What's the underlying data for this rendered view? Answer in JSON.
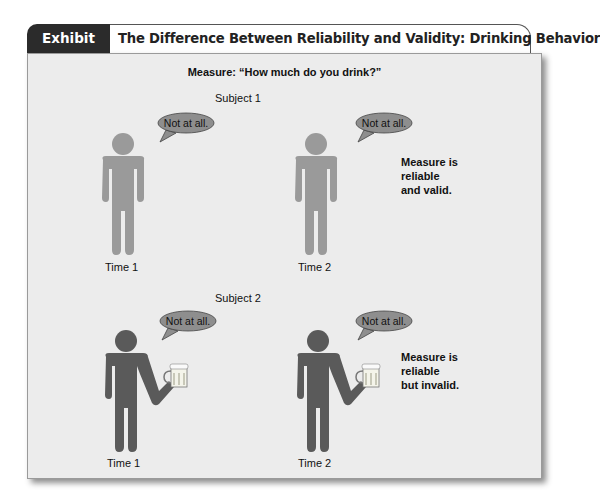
{
  "header": {
    "exhibit_label": "Exhibit 4.17",
    "title": "The Difference Between Reliability and Validity: Drinking Behavior"
  },
  "figure": {
    "measure_text": "Measure: “How much do you drink?”",
    "colors": {
      "panel_bg": "#ececec",
      "valid_figure": "#9a9a9a",
      "invalid_figure": "#5a5a5a",
      "speech_bubble": "#8e8e8e",
      "tab_bg": "#2b2b2b"
    },
    "subjects": [
      {
        "label": "Subject 1",
        "verdict": "Measure is reliable and valid.",
        "verdict_lines": [
          "Measure is",
          "reliable",
          "and valid."
        ],
        "holding_drink": false,
        "observations": [
          {
            "time_label": "Time 1",
            "speech": "Not at all."
          },
          {
            "time_label": "Time 2",
            "speech": "Not at all."
          }
        ]
      },
      {
        "label": "Subject 2",
        "verdict": "Measure is reliable but invalid.",
        "verdict_lines": [
          "Measure is",
          "reliable",
          "but invalid."
        ],
        "holding_drink": true,
        "observations": [
          {
            "time_label": "Time 1",
            "speech": "Not at all."
          },
          {
            "time_label": "Time 2",
            "speech": "Not at all."
          }
        ]
      }
    ]
  }
}
